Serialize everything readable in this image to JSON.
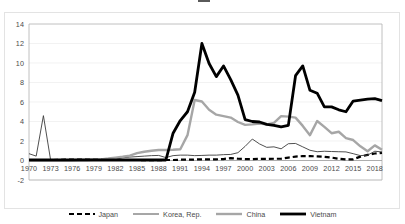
{
  "chart_data": {
    "type": "line",
    "title": "",
    "xlabel": "",
    "ylabel": "",
    "xlim": [
      1970,
      2019
    ],
    "ylim": [
      -2,
      14
    ],
    "ytick_values": [
      14,
      12,
      10,
      8,
      6,
      4,
      2,
      0,
      -2
    ],
    "xtick_values": [
      1970,
      1973,
      1976,
      1979,
      1982,
      1985,
      1988,
      1991,
      1994,
      1997,
      2000,
      2003,
      2006,
      2009,
      2012,
      2015,
      2018
    ],
    "grid": "horizontal",
    "legend_position": "bottom",
    "x": [
      1970,
      1971,
      1972,
      1973,
      1974,
      1975,
      1976,
      1977,
      1978,
      1979,
      1980,
      1981,
      1982,
      1983,
      1984,
      1985,
      1986,
      1987,
      1988,
      1989,
      1990,
      1991,
      1992,
      1993,
      1994,
      1995,
      1996,
      1997,
      1998,
      1999,
      2000,
      2001,
      2002,
      2003,
      2004,
      2005,
      2006,
      2007,
      2008,
      2009,
      2010,
      2011,
      2012,
      2013,
      2014,
      2015,
      2016,
      2017,
      2018,
      2019
    ],
    "series": [
      {
        "name": "Japan",
        "color": "#000000",
        "style": "dashed",
        "width": 2.2,
        "values": [
          0.05,
          0.05,
          0.05,
          0.05,
          0.06,
          0.08,
          0.1,
          0.1,
          0.1,
          0.08,
          0.08,
          0.08,
          0.08,
          0.05,
          0.05,
          0.05,
          0.04,
          0.04,
          0.04,
          0.05,
          0.05,
          0.08,
          0.08,
          0.1,
          0.12,
          0.12,
          0.12,
          0.15,
          0.25,
          0.18,
          0.15,
          0.15,
          0.16,
          0.16,
          0.18,
          0.18,
          0.3,
          0.4,
          0.45,
          0.45,
          0.42,
          0.38,
          0.3,
          0.18,
          0.12,
          0.12,
          0.4,
          0.58,
          0.72,
          0.78
        ]
      },
      {
        "name": "Korea, Rep.",
        "color": "#3b3b3b",
        "style": "solid",
        "width": 0.9,
        "values": [
          0.7,
          0.45,
          4.6,
          0.05,
          0.05,
          0.08,
          0.1,
          0.12,
          0.12,
          0.12,
          0.1,
          0.12,
          0.12,
          0.28,
          0.35,
          0.4,
          0.45,
          0.5,
          0.52,
          0.3,
          0.5,
          0.55,
          0.55,
          0.5,
          0.52,
          0.55,
          0.55,
          0.6,
          0.62,
          0.8,
          1.45,
          2.2,
          1.7,
          1.35,
          1.4,
          1.2,
          1.72,
          1.75,
          1.4,
          1.05,
          0.9,
          0.95,
          0.92,
          0.9,
          0.88,
          0.7,
          0.5,
          0.55,
          0.95,
          0.88
        ]
      },
      {
        "name": "China",
        "color": "#a6a6a6",
        "style": "solid",
        "width": 2.4,
        "values": [
          0.02,
          0.02,
          0.02,
          0.02,
          0.02,
          0.03,
          0.03,
          0.04,
          0.05,
          0.08,
          0.12,
          0.2,
          0.3,
          0.38,
          0.5,
          0.75,
          0.9,
          1.0,
          1.08,
          1.08,
          1.1,
          1.15,
          2.6,
          6.2,
          6.05,
          5.2,
          4.7,
          4.55,
          4.4,
          3.95,
          3.65,
          3.7,
          3.8,
          3.7,
          3.85,
          4.55,
          4.5,
          4.4,
          3.55,
          2.6,
          4.05,
          3.45,
          2.8,
          2.95,
          2.3,
          2.1,
          1.45,
          0.95,
          1.55,
          1.1
        ]
      },
      {
        "name": "Vietnam",
        "color": "#000000",
        "style": "solid",
        "width": 2.8,
        "values": [
          0.05,
          0.05,
          0.05,
          0.05,
          0.05,
          0.05,
          0.05,
          0.05,
          0.05,
          0.05,
          0.05,
          0.05,
          0.05,
          0.05,
          0.05,
          0.05,
          0.05,
          0.05,
          0.05,
          0.05,
          2.8,
          4.1,
          5.0,
          7.0,
          12.0,
          9.95,
          8.6,
          9.7,
          8.3,
          6.7,
          4.2,
          4.0,
          3.95,
          3.7,
          3.6,
          3.45,
          3.6,
          8.7,
          9.7,
          7.2,
          6.9,
          5.5,
          5.5,
          5.2,
          5.0,
          6.1,
          6.2,
          6.3,
          6.35,
          6.15
        ]
      }
    ]
  },
  "legend": {
    "items": [
      {
        "label": "Japan"
      },
      {
        "label": "Korea, Rep."
      },
      {
        "label": "China"
      },
      {
        "label": "Vietnam"
      }
    ]
  }
}
